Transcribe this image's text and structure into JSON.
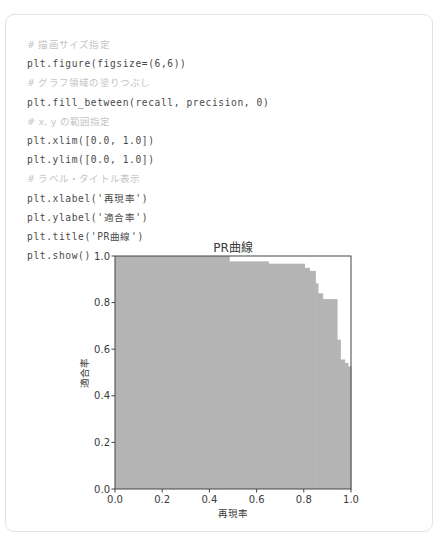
{
  "code": {
    "lines": [
      {
        "type": "comment",
        "text": "# 描画サイズ指定"
      },
      {
        "type": "code",
        "text": "plt.figure(figsize=(6,6))"
      },
      {
        "type": "comment",
        "text": "# グラフ領域の塗りつぶし"
      },
      {
        "type": "code",
        "text": "plt.fill_between(recall, precision, 0)"
      },
      {
        "type": "comment",
        "text": "# x, y の範囲指定"
      },
      {
        "type": "code",
        "text": "plt.xlim([0.0, 1.0])"
      },
      {
        "type": "code",
        "text": "plt.ylim([0.0, 1.0])"
      },
      {
        "type": "comment",
        "text": "# ラベル・タイトル表示"
      },
      {
        "type": "code",
        "text": "plt.xlabel('再現率')"
      },
      {
        "type": "code",
        "text": "plt.ylabel('適合率')"
      },
      {
        "type": "code",
        "text": "plt.title('PR曲線')"
      },
      {
        "type": "code",
        "text": "plt.show()"
      }
    ]
  },
  "colors": {
    "fill": "#b4b4b4",
    "axis": "#444444",
    "card_border": "#e2e2e2"
  },
  "chart_data": {
    "type": "area",
    "title": "PR曲線",
    "xlabel": "再現率",
    "ylabel": "適合率",
    "xlim": [
      0.0,
      1.0
    ],
    "ylim": [
      0.0,
      1.0
    ],
    "xticks": [
      "0.0",
      "0.2",
      "0.4",
      "0.6",
      "0.8",
      "1.0"
    ],
    "yticks": [
      "0.0",
      "0.2",
      "0.4",
      "0.6",
      "0.8",
      "1.0"
    ],
    "grid": false,
    "legend": "none",
    "steps": [
      {
        "recall_start": 0.0,
        "recall_end": 0.484,
        "precision": 1.0
      },
      {
        "recall_start": 0.484,
        "recall_end": 0.65,
        "precision": 0.977
      },
      {
        "recall_start": 0.65,
        "recall_end": 0.803,
        "precision": 0.967
      },
      {
        "recall_start": 0.803,
        "recall_end": 0.824,
        "precision": 0.949
      },
      {
        "recall_start": 0.824,
        "recall_end": 0.849,
        "precision": 0.936
      },
      {
        "recall_start": 0.849,
        "recall_end": 0.86,
        "precision": 0.883
      },
      {
        "recall_start": 0.86,
        "recall_end": 0.88,
        "precision": 0.84
      },
      {
        "recall_start": 0.88,
        "recall_end": 0.941,
        "precision": 0.815
      },
      {
        "recall_start": 0.941,
        "recall_end": 0.955,
        "precision": 0.641
      },
      {
        "recall_start": 0.955,
        "recall_end": 0.973,
        "precision": 0.556
      },
      {
        "recall_start": 0.973,
        "recall_end": 0.987,
        "precision": 0.541
      },
      {
        "recall_start": 0.987,
        "recall_end": 1.0,
        "precision": 0.526
      }
    ]
  }
}
